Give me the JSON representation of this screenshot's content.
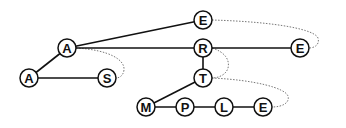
{
  "diagram": {
    "type": "ternary-search-tree",
    "node_radius": 9,
    "colors": {
      "edge": "#111111",
      "link": "#777777",
      "node_fill": "#ffffff"
    },
    "nodes": [
      {
        "id": "n0",
        "label": "A",
        "x": 67,
        "y": 48
      },
      {
        "id": "n1",
        "label": "A",
        "x": 29,
        "y": 78
      },
      {
        "id": "n2",
        "label": "S",
        "x": 107,
        "y": 78
      },
      {
        "id": "n3",
        "label": "E",
        "x": 203,
        "y": 20
      },
      {
        "id": "n4",
        "label": "R",
        "x": 203,
        "y": 48
      },
      {
        "id": "n5",
        "label": "E",
        "x": 300,
        "y": 48
      },
      {
        "id": "n6",
        "label": "T",
        "x": 203,
        "y": 78
      },
      {
        "id": "n7",
        "label": "M",
        "x": 146,
        "y": 107
      },
      {
        "id": "n8",
        "label": "P",
        "x": 185,
        "y": 107
      },
      {
        "id": "n9",
        "label": "L",
        "x": 224,
        "y": 107
      },
      {
        "id": "n10",
        "label": "E",
        "x": 263,
        "y": 107
      }
    ],
    "edges": [
      {
        "from": "n0",
        "to": "n1"
      },
      {
        "from": "n1",
        "to": "n2"
      },
      {
        "from": "n0",
        "to": "n3"
      },
      {
        "from": "n0",
        "to": "n4"
      },
      {
        "from": "n4",
        "to": "n5"
      },
      {
        "from": "n4",
        "to": "n6"
      },
      {
        "from": "n6",
        "to": "n7"
      },
      {
        "from": "n7",
        "to": "n8"
      },
      {
        "from": "n8",
        "to": "n9"
      },
      {
        "from": "n9",
        "to": "n10"
      }
    ],
    "dotted_links": [
      {
        "from": "n0",
        "to": "n2",
        "path": "M76,48 C110,50 125,60 124,70 C123,77 118,78 116,78"
      },
      {
        "from": "n3",
        "to": "n5",
        "path": "M212,20 C280,22 315,30 318,38 C320,45 314,48 309,48"
      },
      {
        "from": "n4",
        "to": "n6",
        "path": "M212,48 C225,52 230,60 228,68 C226,75 218,78 212,78"
      },
      {
        "from": "n6",
        "to": "n10",
        "path": "M212,78 C255,80 285,88 288,96 C290,103 282,107 272,107"
      }
    ]
  }
}
